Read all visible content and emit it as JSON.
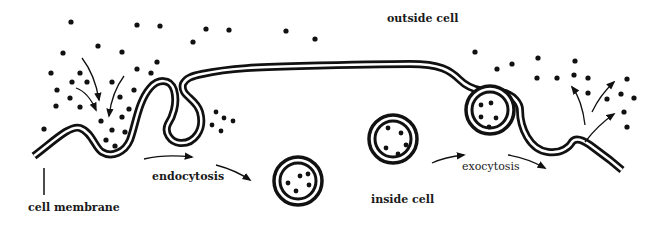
{
  "labels": {
    "outside_cell": "outside cell",
    "inside_cell": "inside cell",
    "endocytosis": "endocytosis",
    "exocytosis": "exocytosis",
    "cell_membrane": "cell membrane"
  },
  "colors": {
    "ink": "#111111",
    "background": "#ffffff"
  }
}
